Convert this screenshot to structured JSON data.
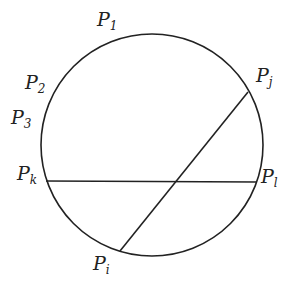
{
  "diagram": {
    "circle": {
      "cx": 152,
      "cy": 145,
      "r": 111,
      "stroke": "#222222"
    },
    "chords": [
      {
        "name": "chord-pi-pj",
        "x1": 120,
        "y1": 251,
        "x2": 248,
        "y2": 92
      },
      {
        "name": "chord-pk-pl",
        "x1": 46,
        "y1": 181,
        "x2": 257,
        "y2": 182
      }
    ],
    "labels": {
      "p1": {
        "base": "P",
        "sub": "1"
      },
      "p2": {
        "base": "P",
        "sub": "2"
      },
      "p3": {
        "base": "P",
        "sub": "3"
      },
      "pj": {
        "base": "P",
        "sub": "j"
      },
      "pk": {
        "base": "P",
        "sub": "k"
      },
      "pl": {
        "base": "P",
        "sub": "l"
      },
      "pi": {
        "base": "P",
        "sub": "i"
      }
    }
  }
}
